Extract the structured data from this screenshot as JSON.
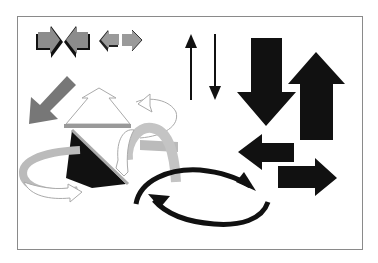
{
  "image": {
    "description": "Clip-art collection of assorted arrow shapes inside a thin gray frame",
    "colors": {
      "black": "#111111",
      "gray_dark": "#6e6e6e",
      "gray_mid": "#9a9a9a",
      "gray_light": "#c4c4c4",
      "outline": "#8a8a8a",
      "background": "#ffffff"
    },
    "arrows": [
      {
        "name": "converging-pair-right",
        "style": "gray with black 3D shadow",
        "direction": "right"
      },
      {
        "name": "converging-pair-left",
        "style": "gray with black 3D shadow",
        "direction": "left"
      },
      {
        "name": "small-gray-left",
        "style": "gray",
        "direction": "left"
      },
      {
        "name": "small-gray-right",
        "style": "gray",
        "direction": "right"
      },
      {
        "name": "thin-up",
        "style": "black line",
        "direction": "up"
      },
      {
        "name": "thin-down",
        "style": "black line",
        "direction": "down"
      },
      {
        "name": "big-black-down",
        "style": "solid black",
        "direction": "down"
      },
      {
        "name": "big-black-up",
        "style": "solid black",
        "direction": "up"
      },
      {
        "name": "gray-diagonal",
        "style": "dark gray",
        "direction": "down-left"
      },
      {
        "name": "outline-up-pyramid",
        "style": "white outline",
        "direction": "up"
      },
      {
        "name": "black-triangle",
        "style": "black with gray edge",
        "direction": "none"
      },
      {
        "name": "curved-ribbon-left",
        "style": "gray ribbon with outline",
        "direction": "circular"
      },
      {
        "name": "curved-ribbon-right",
        "style": "gray ribbon with outline",
        "direction": "circular"
      },
      {
        "name": "medium-black-left",
        "style": "solid black",
        "direction": "left"
      },
      {
        "name": "medium-black-right",
        "style": "solid black",
        "direction": "right"
      },
      {
        "name": "cycle-arrows",
        "style": "black curved pair",
        "direction": "cyclic"
      }
    ]
  }
}
